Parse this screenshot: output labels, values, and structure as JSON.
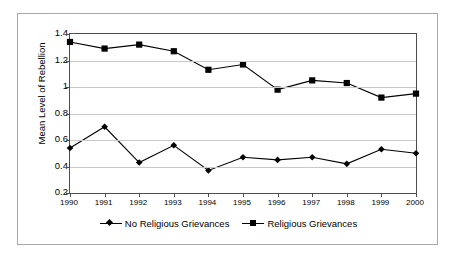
{
  "chart_data": {
    "type": "line",
    "title": "",
    "xlabel": "",
    "ylabel": "Mean Level of Rebellion",
    "categories": [
      "1990",
      "1991",
      "1992",
      "1993",
      "1994",
      "1995",
      "1996",
      "1997",
      "1998",
      "1999",
      "2000"
    ],
    "x": [
      1990,
      1991,
      1992,
      1993,
      1994,
      1995,
      1996,
      1997,
      1998,
      1999,
      2000
    ],
    "ylim": [
      0.2,
      1.4
    ],
    "xlim": [
      1990,
      2000
    ],
    "yticks": [
      0.2,
      0.4,
      0.6,
      0.8,
      1.0,
      1.2,
      1.4
    ],
    "ytick_labels": [
      "0.2",
      "0.4",
      "0.6",
      "0.8",
      "1",
      "1.2",
      "1.4"
    ],
    "grid": "horizontal",
    "legend_position": "bottom",
    "series": [
      {
        "name": "No Religious Grievances",
        "marker": "diamond",
        "color": "#000000",
        "values": [
          0.54,
          0.7,
          0.43,
          0.56,
          0.37,
          0.47,
          0.45,
          0.47,
          0.42,
          0.53,
          0.5
        ]
      },
      {
        "name": "Religious Grievances",
        "marker": "square",
        "color": "#000000",
        "values": [
          1.34,
          1.29,
          1.32,
          1.27,
          1.13,
          1.17,
          0.98,
          1.05,
          1.03,
          0.92,
          0.95
        ]
      }
    ]
  },
  "legend": {
    "items": [
      {
        "label": "No Religious Grievances",
        "marker": "diamond"
      },
      {
        "label": "Religious Grievances",
        "marker": "square"
      }
    ]
  },
  "colors": {
    "line": "#000000",
    "grid": "#c9c9c9",
    "axis": "#4d4d4d",
    "frame": "#a8a8a8",
    "background": "#ffffff",
    "text": "#000000"
  }
}
